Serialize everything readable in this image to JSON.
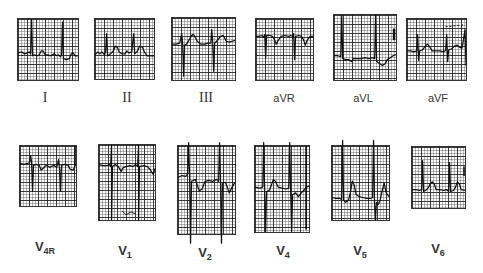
{
  "figure": {
    "rows": [
      {
        "row": "limb-leads",
        "leads": [
          {
            "id": "I",
            "label": "I",
            "style": "roman"
          },
          {
            "id": "II",
            "label": "II",
            "style": "roman"
          },
          {
            "id": "III",
            "label": "III",
            "style": "roman"
          },
          {
            "id": "aVR",
            "label": "aVR",
            "style": "plain"
          },
          {
            "id": "aVL",
            "label": "aVL",
            "style": "plain"
          },
          {
            "id": "aVF",
            "label": "aVF",
            "style": "plain"
          }
        ]
      },
      {
        "row": "precordial-leads",
        "leads": [
          {
            "id": "V4R",
            "label": "V",
            "subscript": "4R"
          },
          {
            "id": "V1",
            "label": "V",
            "subscript": "1"
          },
          {
            "id": "V2",
            "label": "V",
            "subscript": "2"
          },
          {
            "id": "V4",
            "label": "V",
            "subscript": "4"
          },
          {
            "id": "V5",
            "label": "V",
            "subscript": "5"
          },
          {
            "id": "V6",
            "label": "V",
            "subscript": "6"
          }
        ]
      }
    ]
  },
  "colors": {
    "background": "#ffffff",
    "grid": "#333333",
    "trace": "#111111"
  }
}
